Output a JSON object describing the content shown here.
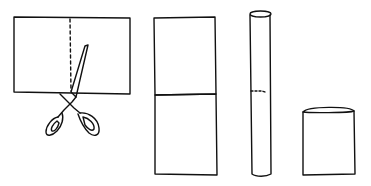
{
  "figure": {
    "ink_color": "#111111",
    "background": "#ffffff",
    "panels": [
      {
        "id": "cut-paper",
        "label": "",
        "icon": "scissors-icon"
      },
      {
        "id": "two-halves",
        "label": ""
      },
      {
        "id": "tall-tube",
        "label": ""
      },
      {
        "id": "short-tube",
        "label": ""
      }
    ]
  }
}
